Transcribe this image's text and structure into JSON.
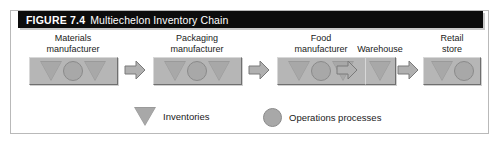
{
  "figure": {
    "title_label": "FIGURE 7.4",
    "title_text": "Multiechelon Inventory Chain",
    "title_bar_color": "#0c0c0c",
    "title_text_color": "#ffffff",
    "frame_border_color": "#b9b9b9"
  },
  "colors": {
    "box_fill": "#b6b6b6",
    "shape_fill": "#a8a8a8",
    "shape_edge": "#8a8a8a",
    "arrow_fill": "#b0b0b0",
    "arrow_edge": "#7a7a7a",
    "text": "#1a1a1a"
  },
  "chain": {
    "nodes": [
      {
        "id": "materials-manufacturer",
        "label_line1": "Materials",
        "label_line2": "manufacturer",
        "shapes": [
          "triangle",
          "circle",
          "triangle"
        ]
      },
      {
        "id": "packaging-manufacturer",
        "label_line1": "Packaging",
        "label_line2": "manufacturer",
        "shapes": [
          "triangle",
          "circle",
          "triangle"
        ]
      },
      {
        "id": "food-manufacturer",
        "label_line1": "Food",
        "label_line2": "manufacturer",
        "shapes": [
          "triangle",
          "circle",
          "triangle"
        ]
      },
      {
        "id": "warehouse",
        "label_line1": "Warehouse",
        "label_line2": "",
        "shapes": [
          "triangle"
        ]
      },
      {
        "id": "retail-store",
        "label_line1": "Retail",
        "label_line2": "store",
        "shapes": [
          "triangle",
          "circle"
        ]
      }
    ],
    "arrows": [
      {
        "id": "arrow-1",
        "direction": "right"
      },
      {
        "id": "arrow-2",
        "direction": "right"
      },
      {
        "id": "arrow-3",
        "direction": "right"
      },
      {
        "id": "arrow-4",
        "direction": "right"
      }
    ]
  },
  "legend": {
    "items": [
      {
        "id": "inventories",
        "symbol": "triangle",
        "label": "Inventories"
      },
      {
        "id": "operations-processes",
        "symbol": "circle",
        "label": "Operations processes"
      }
    ]
  }
}
